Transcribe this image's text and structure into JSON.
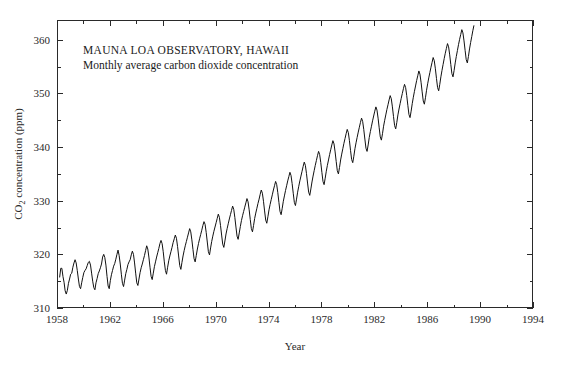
{
  "chart_data": {
    "type": "line",
    "title": "MAUNA LOA OBSERVATORY, HAWAII",
    "subtitle": "Monthly average carbon dioxide concentration",
    "xlabel": "Year",
    "ylabel": "CO2 concentration (ppm)",
    "ylabel_parts": {
      "prefix": "CO",
      "sub": "2",
      "suffix": " concentration (ppm)"
    },
    "xlim": [
      1958,
      1994
    ],
    "ylim": [
      310,
      363.7
    ],
    "xticks_major": [
      1958,
      1962,
      1966,
      1970,
      1974,
      1978,
      1982,
      1986,
      1990,
      1994
    ],
    "xticks_minor": [
      1960,
      1964,
      1968,
      1972,
      1976,
      1980,
      1984,
      1988,
      1992
    ],
    "yticks_major": [
      310,
      320,
      330,
      340,
      350,
      360
    ],
    "yticks_minor": [
      315,
      325,
      335,
      345,
      355
    ],
    "xtick_labels": [
      "1958",
      "1962",
      "1966",
      "1970",
      "1974",
      "1978",
      "1982",
      "1986",
      "1990",
      "1994"
    ],
    "ytick_labels": [
      "310",
      "320",
      "330",
      "340",
      "350",
      "360"
    ],
    "grid": false,
    "legend": "none",
    "line_color": "#111111",
    "frame_color": "#2a2a2a",
    "series": [
      {
        "name": "Monthly average CO2",
        "x_start": 1958.2,
        "x_step": 0.08333333,
        "values": [
          315.7,
          317.4,
          317.4,
          315.9,
          314.8,
          313.2,
          312.6,
          313.3,
          314.6,
          315.4,
          316.3,
          316.5,
          317.6,
          318.4,
          319.0,
          318.4,
          317.0,
          315.4,
          314.0,
          313.6,
          314.7,
          315.7,
          316.6,
          317.0,
          317.3,
          317.9,
          318.5,
          318.7,
          318.0,
          316.5,
          315.0,
          313.8,
          313.4,
          314.7,
          315.5,
          316.4,
          316.9,
          317.5,
          318.2,
          319.5,
          320.0,
          319.4,
          318.0,
          315.9,
          314.1,
          313.6,
          315.1,
          316.2,
          317.0,
          317.8,
          318.3,
          319.1,
          320.0,
          320.8,
          319.8,
          318.2,
          316.3,
          314.6,
          314.0,
          315.2,
          316.4,
          317.2,
          318.1,
          318.6,
          319.0,
          319.9,
          320.6,
          320.0,
          318.4,
          316.5,
          314.7,
          314.2,
          315.4,
          316.6,
          317.5,
          318.2,
          319.0,
          319.8,
          320.7,
          321.6,
          321.0,
          319.5,
          317.6,
          315.9,
          315.3,
          316.5,
          317.7,
          318.6,
          319.5,
          320.3,
          321.1,
          322.0,
          322.6,
          322.0,
          320.5,
          318.6,
          317.0,
          316.3,
          317.6,
          318.8,
          319.7,
          320.5,
          321.3,
          322.2,
          322.9,
          323.6,
          323.0,
          321.5,
          319.7,
          317.9,
          317.2,
          318.5,
          319.7,
          320.7,
          321.6,
          322.4,
          323.2,
          324.0,
          324.8,
          324.2,
          322.7,
          320.9,
          319.2,
          318.6,
          319.8,
          321.0,
          322.0,
          322.9,
          323.7,
          324.5,
          325.4,
          326.1,
          325.6,
          324.1,
          322.3,
          320.5,
          319.9,
          321.2,
          322.4,
          323.4,
          324.3,
          325.1,
          325.9,
          326.7,
          327.5,
          326.9,
          325.4,
          323.6,
          321.9,
          321.3,
          322.5,
          323.8,
          324.8,
          325.7,
          326.6,
          327.4,
          328.2,
          329.0,
          328.4,
          326.9,
          325.1,
          323.4,
          322.8,
          324.0,
          325.2,
          326.3,
          327.2,
          328.0,
          328.8,
          329.6,
          330.4,
          329.8,
          328.3,
          326.5,
          324.8,
          324.2,
          325.4,
          326.7,
          327.7,
          328.6,
          329.5,
          330.3,
          331.2,
          332.0,
          331.4,
          329.9,
          328.1,
          326.4,
          325.8,
          327.0,
          328.3,
          329.3,
          330.2,
          331.1,
          332.0,
          332.8,
          333.6,
          333.0,
          331.5,
          329.7,
          328.0,
          327.4,
          328.6,
          329.9,
          330.9,
          331.9,
          332.8,
          333.7,
          334.5,
          335.3,
          334.7,
          333.2,
          331.4,
          329.7,
          329.1,
          330.3,
          331.6,
          332.7,
          333.7,
          334.6,
          335.5,
          336.4,
          337.2,
          336.6,
          335.1,
          333.3,
          331.6,
          331.0,
          332.2,
          333.5,
          334.6,
          335.6,
          336.6,
          337.5,
          338.4,
          339.2,
          338.6,
          337.1,
          335.3,
          333.6,
          333.0,
          334.2,
          335.5,
          336.6,
          337.6,
          338.6,
          339.5,
          340.4,
          341.2,
          340.6,
          339.1,
          337.3,
          335.6,
          335.0,
          336.2,
          337.6,
          338.7,
          339.7,
          340.7,
          341.6,
          342.5,
          343.3,
          342.7,
          341.2,
          339.4,
          337.7,
          337.1,
          338.3,
          339.7,
          340.8,
          341.8,
          342.8,
          343.7,
          344.6,
          345.4,
          344.8,
          343.3,
          341.5,
          339.8,
          339.2,
          340.4,
          341.8,
          342.9,
          343.9,
          344.9,
          345.8,
          346.7,
          347.5,
          346.9,
          345.4,
          343.6,
          341.9,
          341.3,
          342.5,
          343.9,
          345.0,
          346.0,
          347.0,
          347.9,
          348.8,
          349.6,
          349.0,
          347.5,
          345.7,
          344.0,
          343.4,
          344.6,
          346.0,
          347.1,
          348.1,
          349.1,
          350.0,
          350.9,
          351.7,
          351.1,
          349.6,
          347.8,
          346.1,
          345.5,
          346.7,
          348.1,
          349.3,
          350.4,
          351.4,
          352.4,
          353.3,
          354.2,
          353.6,
          352.1,
          350.3,
          348.6,
          348.0,
          349.2,
          350.6,
          351.8,
          352.9,
          353.9,
          354.9,
          355.8,
          356.7,
          356.1,
          354.6,
          352.8,
          351.1,
          350.5,
          351.7,
          353.1,
          354.3,
          355.4,
          356.5,
          357.5,
          358.4,
          359.3,
          358.7,
          357.2,
          355.4,
          353.7,
          353.1,
          354.3,
          355.7,
          356.9,
          358.0,
          359.1,
          360.1,
          361.0,
          361.9,
          361.3,
          359.8,
          358.0,
          356.3,
          355.7,
          356.9,
          358.3,
          359.5,
          360.6,
          361.7,
          362.7
        ]
      }
    ]
  },
  "figure": {
    "plot_left": 57,
    "plot_right": 533,
    "plot_top": 20,
    "plot_bottom": 308,
    "title_x": 83,
    "title_y": 54,
    "subtitle_y": 69
  }
}
